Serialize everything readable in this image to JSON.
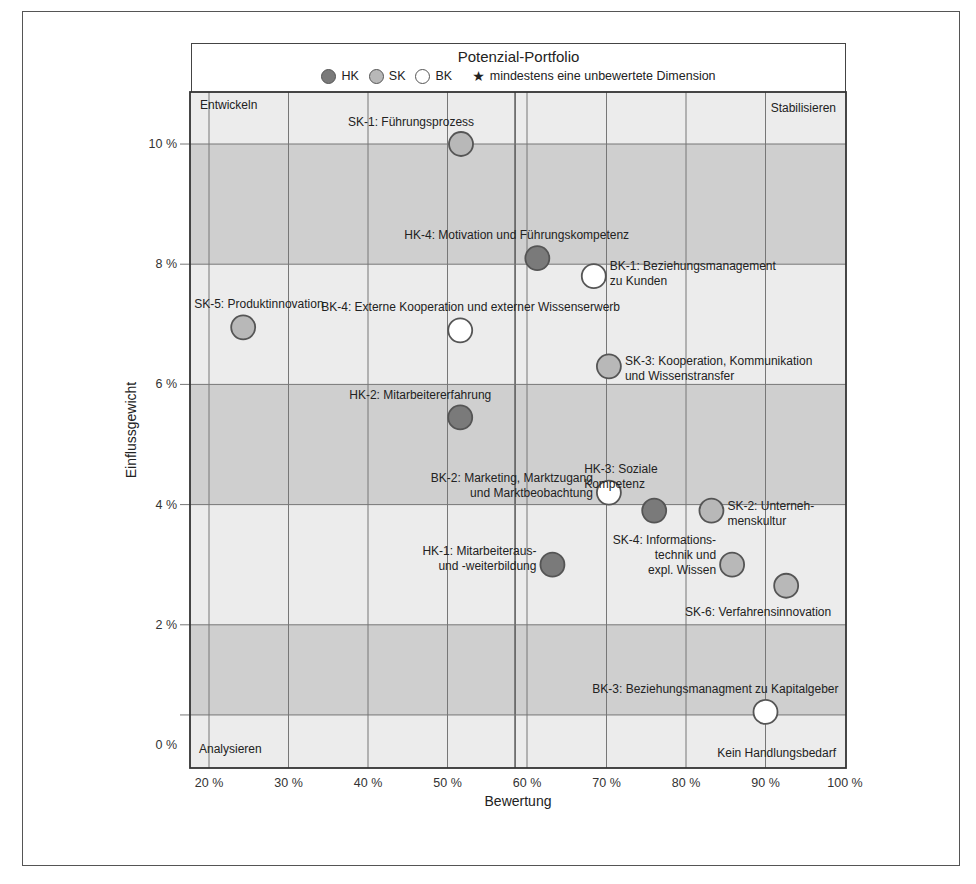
{
  "chart_data": {
    "type": "scatter",
    "title": "Potenzial-Portfolio",
    "xlabel": "Bewertung",
    "ylabel": "Einflussgewicht",
    "xlim": [
      17.6,
      100
    ],
    "ylim": [
      -0.4,
      10.9
    ],
    "x_ticks": [
      "20 %",
      "30 %",
      "40 %",
      "50 %",
      "60 %",
      "70 %",
      "80 %",
      "90 %",
      "100 %"
    ],
    "y_ticks": [
      "0 %",
      "2 %",
      "4 %",
      "6 %",
      "8 %",
      "10 %"
    ],
    "grid": true,
    "extra_vertical_line": 58.5,
    "extra_horizontal_line": 0.5,
    "bands": [
      {
        "from": 8,
        "to": 10,
        "shade": "dark"
      },
      {
        "from": 4,
        "to": 6,
        "shade": "dark"
      },
      {
        "from": 0.5,
        "to": 2,
        "shade": "dark"
      }
    ],
    "legend": [
      {
        "key": "HK",
        "label": "HK",
        "color": "#7a7a7a"
      },
      {
        "key": "SK",
        "label": "SK",
        "color": "#b8b8b8"
      },
      {
        "key": "BK",
        "label": "BK",
        "color": "#ffffff"
      },
      {
        "key": "star",
        "label": "mindestens eine unbewertete Dimension",
        "symbol": "★"
      }
    ],
    "quadrant_labels": {
      "top_left": "Entwickeln",
      "top_right": "Stabilisieren",
      "bottom_left": "Analysieren",
      "bottom_right": "Kein Handlungsbedarf"
    },
    "series": [
      {
        "name": "HK",
        "points": [
          {
            "id": "HK-1",
            "label": [
              "HK-1: Mitarbeiteraus-",
              "und -weiterbildung"
            ],
            "x": 63.2,
            "y": 3.0,
            "anchor": "end",
            "dx": -16,
            "dy": -10
          },
          {
            "id": "HK-2",
            "label": [
              "HK-2: Mitarbeitererfahrung"
            ],
            "x": 51.6,
            "y": 5.45,
            "anchor": "start",
            "dx": -111,
            "dy": -18
          },
          {
            "id": "HK-3",
            "label": [
              "HK-3: Soziale",
              "Kompetenz"
            ],
            "x": 76.0,
            "y": 3.9,
            "anchor": "start",
            "dx": -70,
            "dy": -38
          },
          {
            "id": "HK-4",
            "label": [
              "HK-4: Motivation und Führungskompetenz"
            ],
            "x": 61.3,
            "y": 8.1,
            "anchor": "start",
            "dx": -133,
            "dy": -19
          }
        ]
      },
      {
        "name": "SK",
        "points": [
          {
            "id": "SK-1",
            "label": [
              "SK-1: Führungsprozess"
            ],
            "x": 51.7,
            "y": 10.0,
            "anchor": "start",
            "dx": -113,
            "dy": -18
          },
          {
            "id": "SK-2",
            "label": [
              "SK-2: Unterneh-",
              "menskultur"
            ],
            "x": 83.2,
            "y": 3.9,
            "anchor": "start",
            "dx": 16,
            "dy": -1
          },
          {
            "id": "SK-3",
            "label": [
              "SK-3: Kooperation, Kommunikation",
              "und Wissenstransfer"
            ],
            "x": 70.3,
            "y": 6.3,
            "anchor": "start",
            "dx": 16,
            "dy": -1
          },
          {
            "id": "SK-4",
            "label": [
              "SK-4: Informations-",
              "technik und",
              "expl. Wissen"
            ],
            "x": 85.8,
            "y": 3.0,
            "anchor": "end",
            "dx": -16,
            "dy": -21
          },
          {
            "id": "SK-5",
            "label": [
              "SK-5: Produktinnovation"
            ],
            "x": 24.3,
            "y": 6.95,
            "anchor": "start",
            "dx": -49,
            "dy": -19
          },
          {
            "id": "SK-6",
            "label": [
              "SK-6: Verfahrensinnovation"
            ],
            "x": 92.6,
            "y": 2.65,
            "anchor": "end",
            "dx": 45,
            "dy": 30
          }
        ]
      },
      {
        "name": "BK",
        "points": [
          {
            "id": "BK-1",
            "label": [
              "BK-1: Beziehungsmanagement",
              "zu Kunden"
            ],
            "x": 68.4,
            "y": 7.8,
            "anchor": "start",
            "dx": 16,
            "dy": -6
          },
          {
            "id": "BK-2",
            "label": [
              "BK-2: Marketing, Marktzugang",
              "und Marktbeobachtung"
            ],
            "x": 70.3,
            "y": 4.2,
            "anchor": "end",
            "dx": -16,
            "dy": -11
          },
          {
            "id": "BK-3",
            "label": [
              "BK-3: Beziehungsmanagment zu Kapitalgeber"
            ],
            "x": 90.0,
            "y": 0.55,
            "anchor": "end",
            "dx": 73,
            "dy": -19
          },
          {
            "id": "BK-4",
            "label": [
              "BK-4: Externe Kooperation und externer Wissenserwerb"
            ],
            "x": 51.6,
            "y": 6.9,
            "anchor": "start",
            "dx": -139,
            "dy": -19
          }
        ]
      }
    ]
  }
}
